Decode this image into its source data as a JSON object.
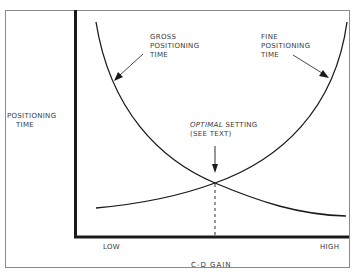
{
  "diagram": {
    "title": "",
    "y_axis_label": [
      "POSITIONING",
      "TIME"
    ],
    "x_axis_label": "C-D GAIN",
    "x_ticks": {
      "low": "LOW",
      "high": "HIGH"
    },
    "annotations": {
      "gross": [
        "GROSS",
        "POSITIONING",
        "TIME"
      ],
      "fine": [
        "FINE",
        "POSITIONING",
        "TIME"
      ],
      "optimal_italic": "OPTIMAL",
      "optimal_rest": " SETTING",
      "optimal_note": "(SEE TEXT)"
    },
    "curves": [
      {
        "name": "Gross positioning time",
        "shape": "decreasing, steep at low gain then flattening at high gain"
      },
      {
        "name": "Fine positioning time",
        "shape": "increasing, flat at low gain then steep at high gain"
      }
    ],
    "intersection": "Optimal setting where both curves cross (marked by dashed vertical line)",
    "colors": {
      "line": "#1a1a1a",
      "border": "#8a8a8a",
      "text": "#3a3a3a"
    }
  }
}
